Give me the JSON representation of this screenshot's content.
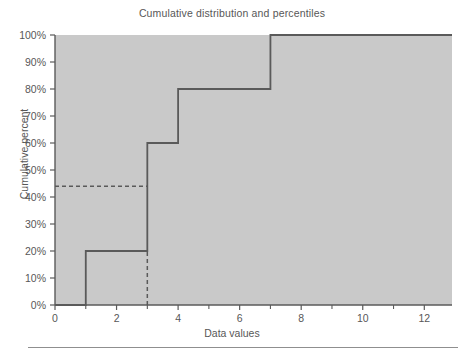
{
  "figure": {
    "title": "Cumulative distribution and percentiles",
    "background_color": "#ffffff",
    "plot_background_color": "#c9c9c9",
    "line_color": "#5a5a5a",
    "text_color": "#575757"
  },
  "chart_data": {
    "type": "line",
    "title": "Cumulative distribution and percentiles",
    "xlabel": "Data values",
    "ylabel": "Cumulative percent",
    "xlim": [
      0,
      12.9
    ],
    "ylim": [
      0,
      100
    ],
    "grid": false,
    "legend": null,
    "x_ticks_major": [
      0,
      2,
      4,
      6,
      8,
      10,
      12
    ],
    "x_tick_labels": [
      "0",
      "2",
      "4",
      "6",
      "8",
      "10",
      "12"
    ],
    "x_ticks_minor": [
      1,
      3,
      5,
      7,
      9,
      11
    ],
    "y_ticks": [
      0,
      10,
      20,
      30,
      40,
      50,
      60,
      70,
      80,
      90,
      100
    ],
    "y_tick_labels": [
      "0%",
      "10%",
      "20%",
      "30%",
      "40%",
      "50%",
      "60%",
      "70%",
      "80%",
      "90%",
      "100%"
    ],
    "series": [
      {
        "name": "Cumulative distribution",
        "style": "step-post",
        "x": [
          0,
          1,
          1,
          3,
          3,
          4,
          4,
          7,
          7,
          12.9
        ],
        "y": [
          0,
          0,
          20,
          20,
          60,
          60,
          80,
          80,
          100,
          100
        ],
        "steps": [
          {
            "x": 1,
            "from_percent": 0,
            "to_percent": 20
          },
          {
            "x": 3,
            "from_percent": 20,
            "to_percent": 60
          },
          {
            "x": 4,
            "from_percent": 60,
            "to_percent": 80
          },
          {
            "x": 7,
            "from_percent": 80,
            "to_percent": 100
          }
        ]
      }
    ],
    "annotations": [
      {
        "name": "percentile-guide",
        "style": "dashed",
        "horizontal": {
          "y_percent": 44,
          "x_from": 0,
          "x_to": 3
        },
        "vertical": {
          "x": 3,
          "y_from": 0,
          "y_to": 20
        }
      }
    ]
  }
}
